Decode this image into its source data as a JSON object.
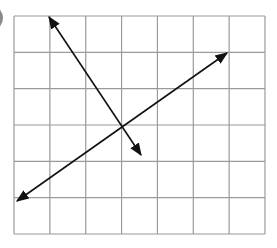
{
  "figure": {
    "grid": {
      "columns": 7,
      "rows": 6,
      "left": 14,
      "top": 16,
      "right": 265,
      "bottom": 234,
      "line_color": "#9a9a9a"
    },
    "lines": [
      {
        "name": "steep-line",
        "from": [
          49,
          17
        ],
        "to": [
          141,
          155
        ],
        "color": "#111111"
      },
      {
        "name": "shallow-line",
        "from": [
          17,
          201
        ],
        "to": [
          227,
          53
        ],
        "color": "#111111"
      }
    ],
    "intersection": [
      122,
      125
    ],
    "label_circle_color": "#8a8a8a"
  }
}
